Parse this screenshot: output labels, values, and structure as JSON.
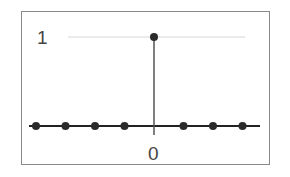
{
  "chart_data": {
    "type": "stem",
    "title": "",
    "xlabel": "",
    "ylabel": "",
    "x": [
      -4,
      -3,
      -2,
      -1,
      0,
      1,
      2,
      3
    ],
    "values": [
      0,
      0,
      0,
      0,
      1,
      0,
      0,
      0
    ],
    "x_tick_labels": [
      {
        "x": 0,
        "label": "0"
      }
    ],
    "y_tick_labels": [
      {
        "y": 1,
        "label": "1"
      }
    ],
    "reference_lines": [
      {
        "y": 1,
        "style": "faint gridline"
      }
    ],
    "grid": false,
    "legend": null,
    "colors": {
      "stem": "#555555",
      "marker": "#2a2a2a",
      "axis": "#222222",
      "frame": "#8a8a8a",
      "gridline": "#d6d6d6"
    }
  },
  "labels": {
    "y_one": "1",
    "x_zero": "0"
  }
}
